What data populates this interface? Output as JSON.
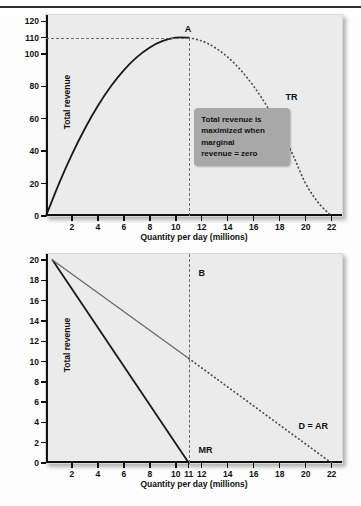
{
  "header": {
    "crumb_left": "",
    "crumb_right": ""
  },
  "figure": {
    "panels": [
      {
        "id": "total-revenue-curve",
        "y_axis_title": "Total revenue",
        "x_axis_title": "Quantity per day (millions)"
      },
      {
        "id": "marginal-revenue-demand",
        "y_axis_title": "Total revenue",
        "x_axis_title": "Quantity per day (millions)"
      }
    ]
  },
  "annotation": {
    "line1": "Total revenue is",
    "line2": "maximized when",
    "line3": "marginal",
    "line4": "revenue = zero"
  },
  "labels": {
    "point_a": "A",
    "point_b": "B",
    "tr": "TR",
    "mr": "MR",
    "d_ar": "D = AR"
  },
  "colors": {
    "panel_background": "#ebebeb",
    "axis": "#111111",
    "curve_solid": "#1a1a1a",
    "curve_dotted": "#4d4d4d",
    "guide": "#6b6b6b",
    "callout_background": "#a8a8a8",
    "d_ar_line": "#6a6a6a"
  },
  "chart_data": [
    {
      "type": "line",
      "id": "total-revenue-curve",
      "title": "",
      "xlabel": "Quantity per day (millions)",
      "ylabel": "Total revenue",
      "xlim": [
        0,
        22.8
      ],
      "ylim": [
        0,
        124
      ],
      "grid": false,
      "legend": "inline-labels",
      "x_ticks": [
        2,
        4,
        6,
        8,
        10,
        12,
        14,
        16,
        18,
        20,
        22
      ],
      "x_tick_labels": [
        "2",
        "4",
        "6",
        "8",
        "10",
        "12",
        "14",
        "16",
        "18",
        "20",
        "22"
      ],
      "y_ticks": [
        0,
        20,
        40,
        60,
        80,
        100,
        110,
        120
      ],
      "y_tick_labels": [
        "0",
        "20",
        "40",
        "60",
        "80",
        "100",
        "110",
        "120"
      ],
      "series": [
        {
          "name": "TR",
          "style": "solid-then-dotted",
          "solid_until_x": 11,
          "points": [
            {
              "x": 0,
              "y": 0
            },
            {
              "x": 1,
              "y": 20
            },
            {
              "x": 2,
              "y": 38
            },
            {
              "x": 3,
              "y": 54
            },
            {
              "x": 4,
              "y": 68
            },
            {
              "x": 5,
              "y": 80
            },
            {
              "x": 6,
              "y": 90
            },
            {
              "x": 7,
              "y": 98
            },
            {
              "x": 8,
              "y": 104
            },
            {
              "x": 9,
              "y": 108
            },
            {
              "x": 10,
              "y": 110
            },
            {
              "x": 11,
              "y": 110
            },
            {
              "x": 12,
              "y": 108
            },
            {
              "x": 13,
              "y": 104
            },
            {
              "x": 14,
              "y": 98
            },
            {
              "x": 15,
              "y": 90
            },
            {
              "x": 16,
              "y": 80
            },
            {
              "x": 17,
              "y": 68
            },
            {
              "x": 18,
              "y": 54
            },
            {
              "x": 19,
              "y": 38
            },
            {
              "x": 20,
              "y": 20
            },
            {
              "x": 21,
              "y": 8
            },
            {
              "x": 22,
              "y": 0
            }
          ]
        }
      ],
      "annotations": [
        {
          "label": "A",
          "x": 11,
          "y": 110,
          "note": "maximum of total revenue"
        },
        {
          "label": "TR",
          "x": 18.3,
          "y": 73,
          "note": "curve name"
        },
        {
          "text": "Total revenue is maximized when marginal revenue = zero",
          "x": 14.5,
          "y": 52
        }
      ],
      "guides": [
        {
          "orientation": "horizontal",
          "value": 110,
          "from_x": 0,
          "to_x": 11,
          "style": "dashed"
        },
        {
          "orientation": "vertical",
          "value": 11,
          "from_y": 0,
          "to_y": 110,
          "style": "dashed"
        }
      ]
    },
    {
      "type": "line",
      "id": "marginal-revenue-demand",
      "title": "",
      "xlabel": "Quantity per day (millions)",
      "ylabel": "Total revenue",
      "xlim": [
        0,
        22.8
      ],
      "ylim": [
        0,
        20.6
      ],
      "grid": false,
      "legend": "inline-labels",
      "x_ticks": [
        2,
        4,
        6,
        8,
        10,
        11,
        12,
        14,
        16,
        18,
        20,
        22
      ],
      "x_tick_labels": [
        "2",
        "4",
        "6",
        "8",
        "10",
        "11",
        "12",
        "14",
        "16",
        "18",
        "20",
        "22"
      ],
      "y_ticks": [
        0,
        2,
        4,
        6,
        8,
        10,
        12,
        14,
        16,
        18,
        20
      ],
      "y_tick_labels": [
        "0",
        "2",
        "4",
        "6",
        "8",
        "10",
        "12",
        "14",
        "16",
        "18",
        "20"
      ],
      "series": [
        {
          "name": "MR",
          "style": "solid",
          "points": [
            {
              "x": 0.5,
              "y": 20
            },
            {
              "x": 11,
              "y": 0
            }
          ]
        },
        {
          "name": "D = AR",
          "style": "solid-then-dotted",
          "solid_until_x": 11,
          "points": [
            {
              "x": 0.5,
              "y": 20
            },
            {
              "x": 11,
              "y": 10.3
            },
            {
              "x": 22,
              "y": 0
            }
          ]
        }
      ],
      "annotations": [
        {
          "label": "B",
          "x": 11.6,
          "y": 18.6,
          "note": "point on demand axis marker"
        },
        {
          "label": "MR",
          "x": 11.6,
          "y": 1.2,
          "note": "marginal revenue line name"
        },
        {
          "label": "D = AR",
          "x": 19.3,
          "y": 3.5,
          "note": "demand equals average revenue"
        }
      ],
      "guides": [
        {
          "orientation": "vertical",
          "value": 11,
          "from_y": 0,
          "to_y": 20.6,
          "style": "dashed"
        }
      ]
    }
  ]
}
